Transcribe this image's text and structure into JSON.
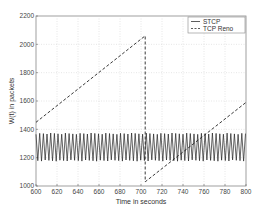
{
  "chart_data": {
    "type": "line",
    "title": "",
    "xlabel": "Time in seconds",
    "ylabel": "W(t) in packets",
    "xlim": [
      600,
      800
    ],
    "ylim": [
      1000,
      2200
    ],
    "xticks": [
      600,
      620,
      640,
      660,
      680,
      700,
      720,
      740,
      760,
      780,
      800
    ],
    "yticks": [
      1000,
      1200,
      1400,
      1600,
      1800,
      2000,
      2200
    ],
    "grid": true,
    "legend_position": "upper right",
    "series": [
      {
        "name": "STCP",
        "style": "solid",
        "description": "Rapid sawtooth oscillation between about 1180 and 1370 packets with period of about 3.5 s",
        "min": 1180,
        "max": 1370,
        "period_s": 3.5,
        "x": [
          600,
          800
        ],
        "range": [
          1180,
          1370
        ]
      },
      {
        "name": "TCP Reno",
        "style": "dashed",
        "x": [
          600,
          704,
          704,
          800
        ],
        "y": [
          1450,
          2060,
          1030,
          1590
        ]
      }
    ]
  },
  "legend": {
    "items": [
      "STCP",
      "TCP Reno"
    ]
  }
}
